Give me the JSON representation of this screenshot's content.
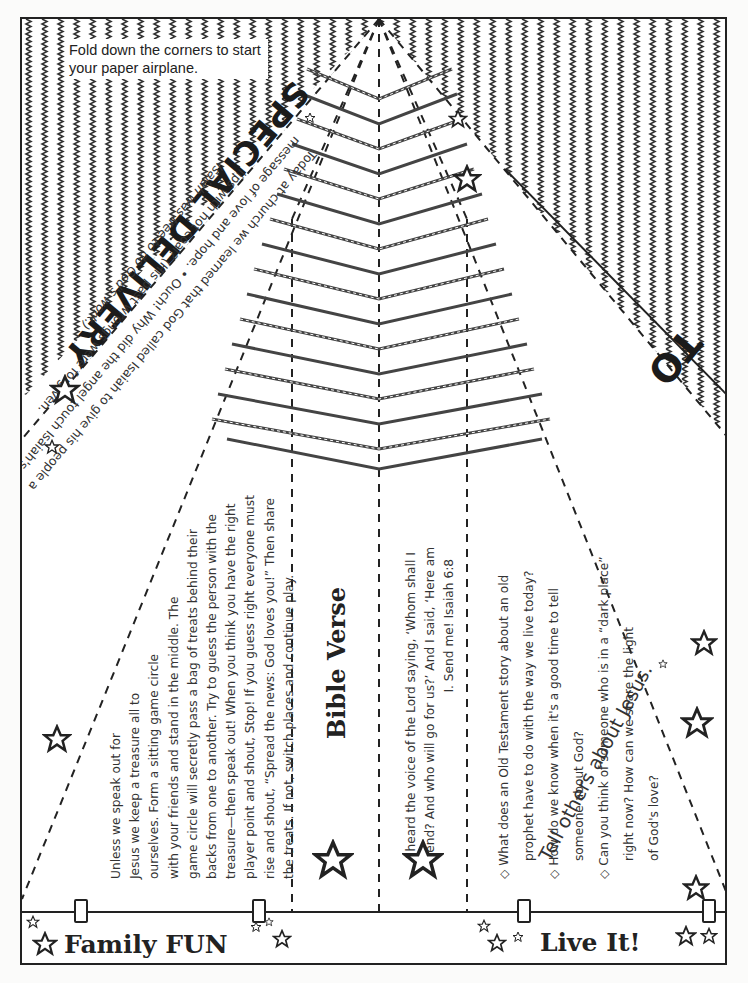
{
  "instructions": {
    "fold_note": "Fold down the corners to start your paper airplane."
  },
  "header": {
    "title": "SPECIAL DELIVERY",
    "intro_lines": [
      "Today at church we learned that God called Isaiah to give his people a",
      "message of love and hope.  •  Ouch! Why did the angel touch Isaiah's",
      "lips with hot coal? (His past wrongs were forgiven.",
      "Isaiah was free to do God's work.)"
    ]
  },
  "address": {
    "to_label": "TO",
    "tagline": "Tell others about Jesus."
  },
  "family_fun": {
    "label": "Family FUN",
    "lines": [
      "Unless we speak out for",
      "Jesus we keep a treasure all to",
      "ourselves. Form a sitting game circle",
      "with your friends and stand in the middle. The",
      "game circle will secretly pass a bag of treats behind their",
      "backs from one to another. Try to guess the person with the",
      "treasure—then speak out! When you think you have the right",
      "player point and shout, Stop! If you guess right everyone must",
      "rise and shout, “Spread the news: God loves you!” Then share",
      "the treats. If not, switch places and continue play."
    ]
  },
  "bible_verse": {
    "title": "Bible Verse",
    "lines": [
      "I heard the voice of the Lord saying, ‘Whom shall I",
      "send? And who will go for us?’ And I said, ‘Here am",
      "I. Send me! Isaiah 6:8"
    ]
  },
  "live_it": {
    "label": "Live It!",
    "questions": [
      {
        "bullet": "◇",
        "line1": "What does an Old Testament story about an old",
        "line2": "prophet have to do with the way we live today?"
      },
      {
        "bullet": "◇",
        "line1": "How do we know when it's a good time to tell",
        "line2": "someone about God?"
      },
      {
        "bullet": "◇",
        "line1": "Can you think of someone who is in a “dark place”",
        "line2": "right now? How can we share the light",
        "line3": "of God's love?"
      }
    ]
  },
  "colors": {
    "ink": "#222222",
    "paper": "#ffffff",
    "text": "#333333"
  }
}
